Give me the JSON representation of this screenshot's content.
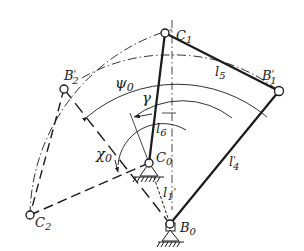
{
  "diagram": {
    "type": "planar linkage mechanism sketch",
    "colors": {
      "ink": "#1a1a1a",
      "background": "#ffffff"
    },
    "points": {
      "C1": {
        "label": "C",
        "sub": "1",
        "x": 165,
        "y": 33
      },
      "B1p": {
        "label": "B",
        "sub": "1",
        "prime": "'",
        "x": 279,
        "y": 91
      },
      "B2p": {
        "label": "B",
        "sub": "2",
        "prime": "'",
        "x": 64,
        "y": 89
      },
      "C2": {
        "label": "C",
        "sub": "2",
        "x": 30,
        "y": 215
      },
      "C0": {
        "label": "C",
        "sub": "0",
        "x": 149,
        "y": 163
      },
      "B0": {
        "label": "B",
        "sub": "0",
        "x": 170,
        "y": 224
      }
    },
    "links": {
      "l5": {
        "label": "l",
        "sub": "5"
      },
      "l6": {
        "label": "l",
        "sub": "6"
      },
      "l4p": {
        "label": "l",
        "sub": "4",
        "prime": "'"
      },
      "l1p": {
        "label": "l",
        "sub": "1",
        "prime": "'"
      }
    },
    "angles": {
      "psi0": {
        "label": "ψ",
        "sub": "0"
      },
      "gamma": {
        "label": "γ"
      },
      "chi0": {
        "label": "χ",
        "sub": "0"
      }
    }
  }
}
